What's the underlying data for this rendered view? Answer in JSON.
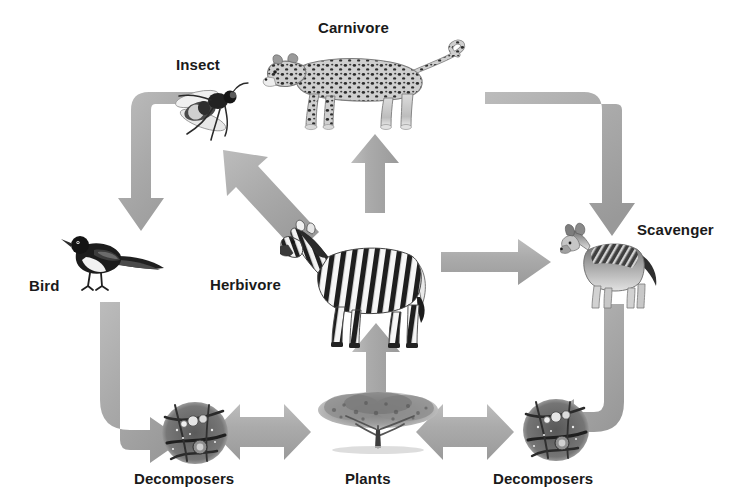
{
  "diagram": {
    "background_color": "#ffffff",
    "arrow_color": "#a9a9a9",
    "arrow_color_dark": "#949494",
    "arrow_color_light": "#c2c2c2",
    "label_color": "#1a1a1a"
  },
  "nodes": {
    "carnivore": {
      "label": "Carnivore",
      "organism": "leopard"
    },
    "insect": {
      "label": "Insect",
      "organism": "fly"
    },
    "bird": {
      "label": "Bird",
      "organism": "magpie"
    },
    "herbivore": {
      "label": "Herbivore",
      "organism": "zebra"
    },
    "scavenger": {
      "label": "Scavenger",
      "organism": "jackal"
    },
    "decomposers_left": {
      "label": "Decomposers",
      "organism": "microbes"
    },
    "plants": {
      "label": "Plants",
      "organism": "acacia-tree"
    },
    "decomposers_right": {
      "label": "Decomposers",
      "organism": "microbes"
    }
  },
  "edges": [
    {
      "from": "plants",
      "to": "herbivore",
      "style": "straight-up",
      "heads": 1
    },
    {
      "from": "herbivore",
      "to": "carnivore",
      "style": "straight-up",
      "heads": 1
    },
    {
      "from": "herbivore",
      "to": "insect",
      "style": "diagonal-up-left",
      "heads": 1
    },
    {
      "from": "herbivore",
      "to": "scavenger",
      "style": "straight-right",
      "heads": 1
    },
    {
      "from": "insect",
      "to": "bird",
      "style": "elbow-down-left",
      "heads": 1
    },
    {
      "from": "carnivore",
      "to": "scavenger",
      "style": "elbow-down-right",
      "heads": 1
    },
    {
      "from": "bird",
      "to": "decomposers_left",
      "style": "elbow-down-right",
      "heads": 1
    },
    {
      "from": "scavenger",
      "to": "decomposers_right",
      "style": "elbow-down-left",
      "heads": 1
    },
    {
      "from": "decomposers_left",
      "to": "plants",
      "style": "horizontal",
      "heads": 2
    },
    {
      "from": "plants",
      "to": "decomposers_right",
      "style": "horizontal",
      "heads": 2
    }
  ]
}
